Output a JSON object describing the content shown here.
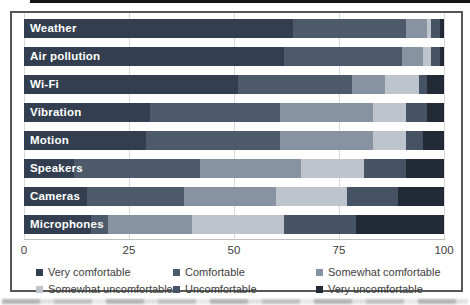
{
  "chart_data": {
    "type": "bar",
    "subtype": "horizontal-stacked-percent",
    "title": "",
    "categories": [
      "Weather",
      "Air pollution",
      "Wi-Fi",
      "Vibration",
      "Motion",
      "Speakers",
      "Cameras",
      "Microphones"
    ],
    "series": [
      {
        "name": "Very comfortable",
        "color": "#333F50",
        "values": [
          64,
          62,
          51,
          30,
          29,
          12,
          15,
          16
        ]
      },
      {
        "name": "Comfortable",
        "color": "#4C5A6B",
        "values": [
          27,
          28,
          27,
          31,
          32,
          30,
          23,
          4
        ]
      },
      {
        "name": "Somewhat comfortable",
        "color": "#8793A0",
        "values": [
          5,
          5,
          8,
          22,
          22,
          24,
          22,
          20
        ]
      },
      {
        "name": "Somewhat uncomfortable",
        "color": "#BEC4CB",
        "values": [
          1,
          2,
          8,
          8,
          8,
          15,
          17,
          22
        ]
      },
      {
        "name": "Uncomfortable",
        "color": "#465364",
        "values": [
          2,
          2,
          2,
          5,
          4,
          10,
          12,
          17
        ]
      },
      {
        "name": "Very uncomfortable",
        "color": "#222A35",
        "values": [
          1,
          1,
          4,
          4,
          5,
          9,
          11,
          21
        ]
      }
    ],
    "xlabel": "",
    "ylabel": "",
    "xlim": [
      0,
      100
    ],
    "x_ticks": [
      0,
      25,
      50,
      75,
      100
    ],
    "grid": "vertical",
    "legend_position": "bottom"
  },
  "colors": {
    "background": "#FFFFFF",
    "frame_border": "#565656",
    "grid": "#D9D9D9",
    "axis_line": "#BFBFBF",
    "tick_text": "#404040",
    "legend_text": "#404040",
    "bar_label_text": "#FFFFFF"
  }
}
